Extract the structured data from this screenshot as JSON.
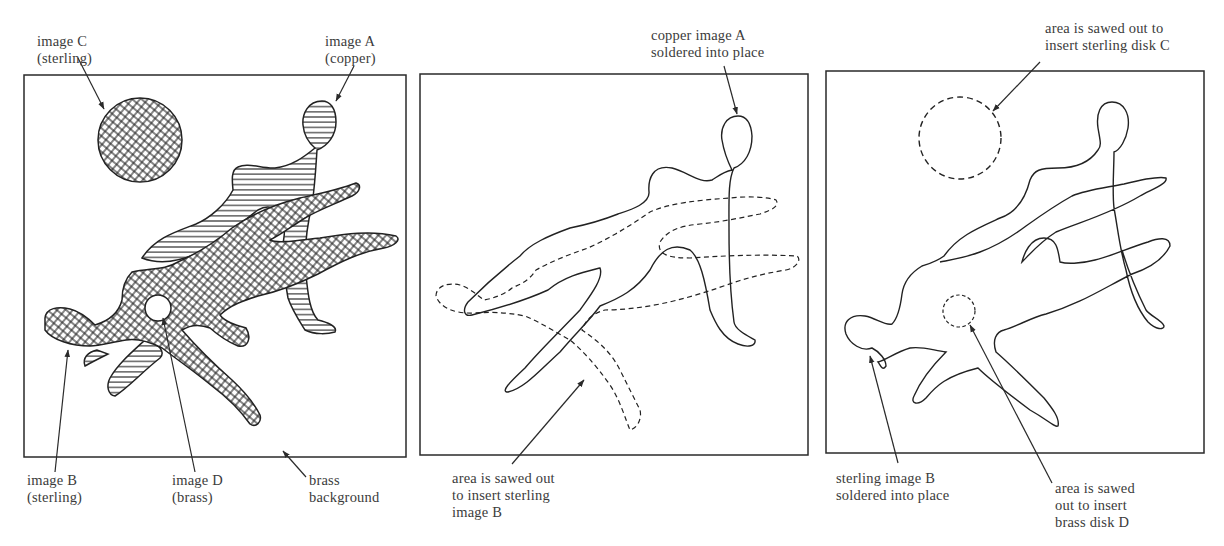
{
  "figure": {
    "panels": [
      {
        "id": "panel-1",
        "labels": {
          "image_c": [
            "image C",
            "(sterling)"
          ],
          "image_a": [
            "image A",
            "(copper)"
          ],
          "image_b": [
            "image B",
            "(sterling)"
          ],
          "image_d": [
            "image D",
            "(brass)"
          ],
          "background": [
            "brass",
            "background"
          ]
        }
      },
      {
        "id": "panel-2",
        "labels": {
          "copper_a": [
            "copper image A",
            "soldered into place"
          ],
          "sawed_b": [
            "area is sawed out",
            "to insert sterling",
            "image B"
          ]
        }
      },
      {
        "id": "panel-3",
        "labels": {
          "sawed_c": [
            "area is sawed out to",
            "insert sterling disk C"
          ],
          "sterling_b": [
            "sterling image B",
            "soldered into place"
          ],
          "sawed_d": [
            "area is sawed",
            "out to insert",
            "brass disk D"
          ]
        }
      }
    ],
    "colors": {
      "line": "#2a2a2a",
      "text": "#3b3b3b",
      "background": "#ffffff"
    }
  }
}
